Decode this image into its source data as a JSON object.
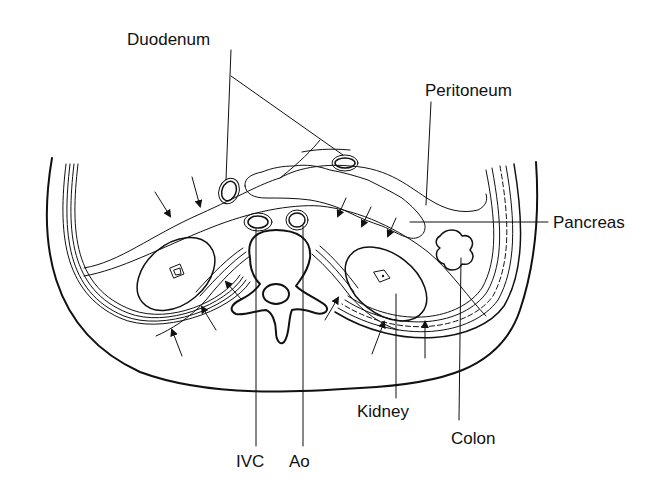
{
  "diagram": {
    "type": "anatomical cross-section",
    "colors": {
      "ink": "#111111",
      "background": "#ffffff",
      "stipple": "#555555"
    },
    "labels": {
      "duodenum": "Duodenum",
      "peritoneum": "Peritoneum",
      "pancreas": "Pancreas",
      "kidney": "Kidney",
      "colon": "Colon",
      "ivc": "IVC",
      "aorta": "Ao"
    },
    "arrows": {
      "count": 12,
      "description": "Arrows indicating fascial planes around the kidneys and anterior pararenal space"
    }
  }
}
